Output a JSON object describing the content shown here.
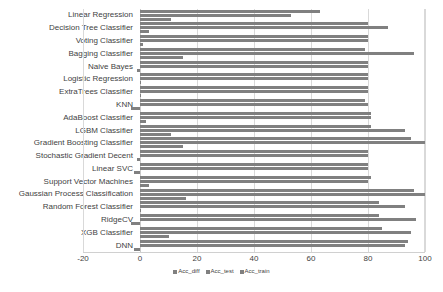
{
  "chart_data": {
    "type": "bar",
    "orientation": "horizontal",
    "title": "",
    "xlabel": "",
    "ylabel": "",
    "xlim": [
      -20,
      100
    ],
    "xticks": [
      -20,
      0,
      20,
      40,
      60,
      80,
      100
    ],
    "xtick_labels": [
      "-20",
      "0",
      "20",
      "40",
      "60",
      "80",
      "100"
    ],
    "grid": true,
    "legend_position": "bottom",
    "bar_color": "#808080",
    "gridline_color": "#d9d9d9",
    "categories": [
      "Linear Regression",
      "Decision Tree Classifier",
      "Voting Classifier",
      "Bagging Classifier",
      "Naive Bayes",
      "Logistic Regression",
      "ExtraTrees Classifier",
      "KNN",
      "AdaBoost Classifier",
      "LGBM Classifier",
      "Gradient Boosting Classifier",
      "Stochastic Gradient Decent",
      "Linear SVC",
      "Support Vector Machines",
      "Gaussian Process Classification",
      "Random Forest Classifier",
      "RidgeCV",
      "XGB Classifier",
      "DNN"
    ],
    "series": [
      {
        "name": "Acc_train",
        "values": [
          63,
          80,
          80,
          79,
          80,
          80,
          80,
          79,
          81,
          81,
          95,
          80,
          80,
          81,
          96,
          84,
          84,
          85,
          94
        ]
      },
      {
        "name": "Acc_test",
        "values": [
          53,
          87,
          80,
          96,
          80,
          80,
          80,
          80,
          81,
          93,
          100,
          80,
          80,
          80,
          100,
          93,
          97,
          95,
          93
        ]
      },
      {
        "name": "Acc_diff",
        "values": [
          11,
          3,
          1,
          15,
          -1,
          0,
          0,
          -3,
          2,
          11,
          15,
          -1,
          -2,
          3,
          16,
          0,
          -3,
          10,
          -2
        ]
      }
    ],
    "legend": [
      "Acc_diff",
      "Acc_test",
      "Acc_train"
    ]
  }
}
